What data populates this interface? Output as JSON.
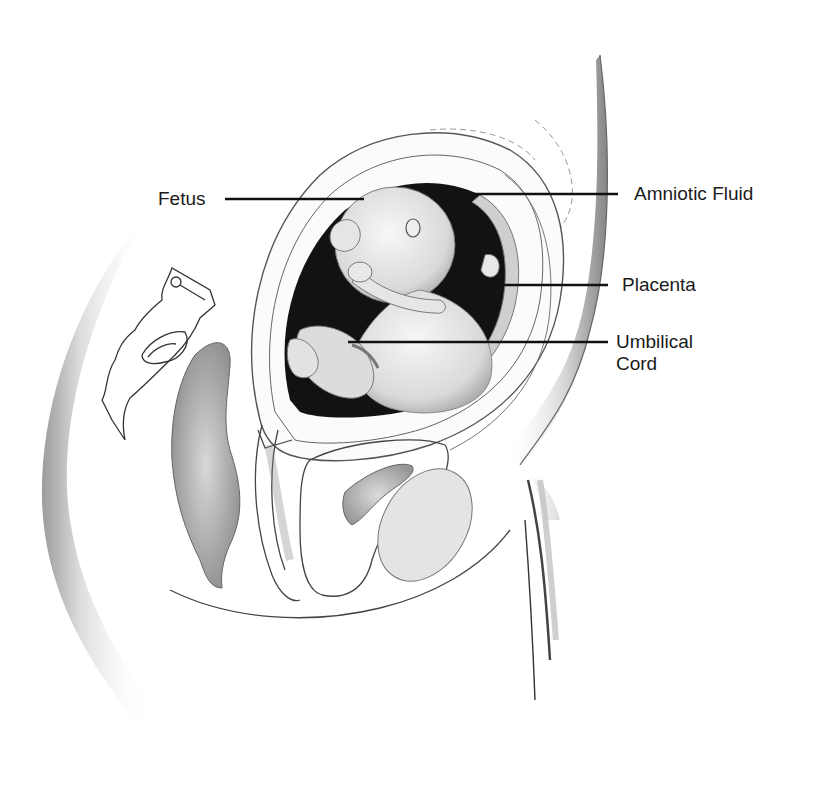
{
  "diagram": {
    "type": "anatomical-illustration",
    "labels": [
      {
        "id": "fetus",
        "text": "Fetus",
        "side": "left"
      },
      {
        "id": "amniotic-fluid",
        "text": "Amniotic Fluid",
        "side": "right"
      },
      {
        "id": "placenta",
        "text": "Placenta",
        "side": "right"
      },
      {
        "id": "umbilical-cord",
        "text": "Umbilical\nCord",
        "side": "right"
      }
    ],
    "colors": {
      "background": "#ffffff",
      "ink": "#1a1a1a",
      "line": "#444444",
      "shade": "#9a9a9a",
      "fluid": "#111111"
    }
  }
}
